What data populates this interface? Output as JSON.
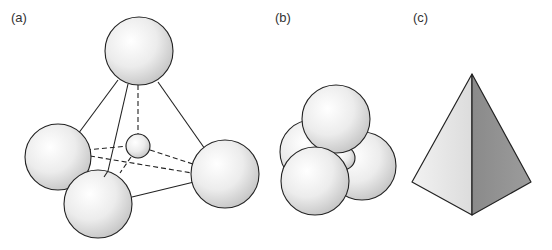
{
  "panels": [
    {
      "label": "(a)",
      "description": "Tetrahedral arrangement of four large spheres with a small sphere in the center, edges drawn as lines"
    },
    {
      "label": "(b)",
      "description": "Close-packed cluster of four spheres around a small central sphere"
    },
    {
      "label": "(c)",
      "description": "Tetrahedron (triangular pyramid) solid"
    }
  ],
  "colors": {
    "stroke": "#222222",
    "sphere_light": "#ffffff",
    "sphere_dark": "#cfcfcf",
    "face_light": "#e6e6e6",
    "face_dark": "#8c8c8c"
  }
}
